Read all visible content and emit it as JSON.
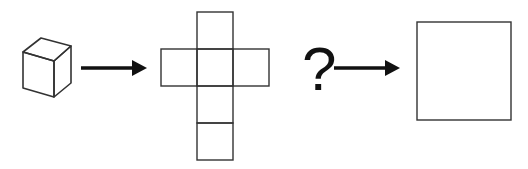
{
  "diagram": {
    "elements": [
      {
        "id": "cube",
        "shape": "isometric cube"
      },
      {
        "id": "arrow-1",
        "shape": "right arrow"
      },
      {
        "id": "cube-net",
        "shape": "cross net of 6 squares"
      },
      {
        "id": "question-mark",
        "text": "?"
      },
      {
        "id": "arrow-2",
        "shape": "right arrow"
      },
      {
        "id": "result-square",
        "shape": "square"
      }
    ],
    "question_text": "?",
    "stroke_color": "#333333",
    "arrow_color": "#111111"
  }
}
